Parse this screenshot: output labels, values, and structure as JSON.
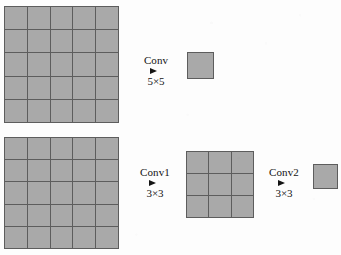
{
  "figure": {
    "type": "diagram",
    "canvas": {
      "width": 341,
      "height": 255
    },
    "colors": {
      "cell_fill": "#a9a9a9",
      "grid_line": "#5d5d5d",
      "arrow": "#141414",
      "background": "#fdfdfd"
    }
  },
  "rows": [
    {
      "id": "single-5x5-path",
      "nodes": [
        {
          "id": "top-input-map",
          "name": "input-feature-map",
          "kind": "grid",
          "rows": 5,
          "cols": 5,
          "cell_count": 25,
          "x": 4,
          "y": 6,
          "width": 115,
          "height": 117
        },
        {
          "id": "top-output-map",
          "name": "output-feature-map",
          "kind": "solid",
          "rows": 1,
          "cols": 1,
          "cell_count": 1,
          "x": 187,
          "y": 52,
          "width": 27,
          "height": 27
        }
      ],
      "arrows": [
        {
          "id": "conv-5x5",
          "label": "Conv",
          "sublabel": "5×5",
          "kernel": "5×5",
          "x": 128,
          "y": 55,
          "width": 56
        }
      ]
    },
    {
      "id": "stacked-3x3-path",
      "nodes": [
        {
          "id": "bottom-input-map",
          "name": "input-feature-map",
          "kind": "grid",
          "rows": 5,
          "cols": 5,
          "cell_count": 25,
          "x": 4,
          "y": 137,
          "width": 115,
          "height": 112
        },
        {
          "id": "bottom-middle-map",
          "name": "intermediate-feature-map",
          "kind": "grid",
          "rows": 3,
          "cols": 3,
          "cell_count": 9,
          "x": 186,
          "y": 151,
          "width": 68,
          "height": 67
        },
        {
          "id": "bottom-output-map",
          "name": "output-feature-map",
          "kind": "solid",
          "rows": 1,
          "cols": 1,
          "cell_count": 1,
          "x": 313,
          "y": 164,
          "width": 25,
          "height": 25
        }
      ],
      "arrows": [
        {
          "id": "conv1-3x3",
          "label": "Conv1",
          "sublabel": "3×3",
          "kernel": "3×3",
          "x": 128,
          "y": 167,
          "width": 54
        },
        {
          "id": "conv2-3x3",
          "label": "Conv2",
          "sublabel": "3×3",
          "kernel": "3×3",
          "x": 258,
          "y": 167,
          "width": 52
        }
      ]
    }
  ]
}
